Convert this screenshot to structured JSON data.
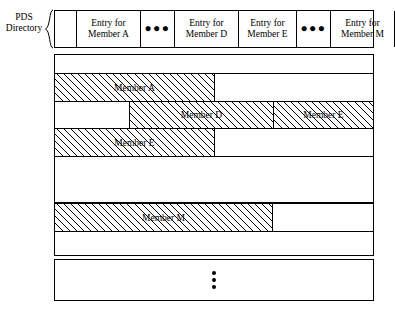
{
  "diagram": {
    "title_caption": {
      "line1": "PDS",
      "line2": "Directory"
    },
    "directory": {
      "cells": [
        {
          "kind": "blank",
          "line1": "",
          "line2": ""
        },
        {
          "kind": "entry",
          "line1": "Entry for",
          "line2": "Member A"
        },
        {
          "kind": "dots",
          "line1": "●●●",
          "line2": ""
        },
        {
          "kind": "entry",
          "line1": "Entry for",
          "line2": "Member D"
        },
        {
          "kind": "entry",
          "line1": "Entry for",
          "line2": "Member E"
        },
        {
          "kind": "dots",
          "line1": "●●●",
          "line2": ""
        },
        {
          "kind": "entry",
          "line1": "Entry for",
          "line2": "Member M"
        },
        {
          "kind": "blank",
          "line1": "",
          "line2": ""
        }
      ]
    },
    "rows": [
      {
        "name": "row-empty-1",
        "segments": [
          {
            "label": "",
            "hatched": false
          }
        ]
      },
      {
        "name": "row-member-a",
        "segments": [
          {
            "label": "Member A",
            "hatched": true
          },
          {
            "label": "",
            "hatched": false
          }
        ]
      },
      {
        "name": "row-member-d-e",
        "segments": [
          {
            "label": "",
            "hatched": false
          },
          {
            "label": "Member D",
            "hatched": true
          },
          {
            "label": "Member E",
            "hatched": true
          }
        ]
      },
      {
        "name": "row-member-e",
        "segments": [
          {
            "label": "Member E",
            "hatched": true
          },
          {
            "label": "",
            "hatched": false
          }
        ]
      },
      {
        "name": "row-empty-2",
        "segments": [
          {
            "label": "",
            "hatched": false
          }
        ]
      },
      {
        "name": "row-member-m",
        "segments": [
          {
            "label": "Member M",
            "hatched": true
          },
          {
            "label": "",
            "hatched": false
          }
        ]
      },
      {
        "name": "row-empty-3",
        "segments": [
          {
            "label": "",
            "hatched": false
          }
        ]
      },
      {
        "name": "row-vertical-ellipsis",
        "segments": [
          {
            "label": "",
            "hatched": false
          }
        ],
        "vertical_dots": 3
      }
    ],
    "colors": {
      "line": "#000000",
      "background": "#ffffff",
      "hatch": "#000000"
    }
  }
}
